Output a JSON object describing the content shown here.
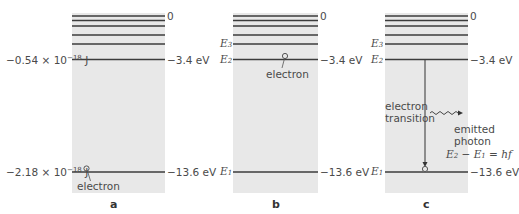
{
  "colors": {
    "box_fill": "#e8e8e8",
    "level_line": "#3c3c3c",
    "text": "#4a4a4a"
  },
  "panels": [
    {
      "id": "a",
      "label": "a",
      "top_level_label": "0",
      "upper_level_right": "−3.4 eV",
      "upper_level_left": "−0.54 × 10",
      "upper_level_left_exp": "−18",
      "upper_level_left_unit": " J",
      "ground_level_right": "−13.6 eV",
      "ground_level_left": "−2.18 × 10",
      "ground_level_left_exp": "−18",
      "ground_level_left_unit": " J",
      "electron_label": "electron"
    },
    {
      "id": "b",
      "label": "b",
      "top_level_label": "0",
      "upper_level_right": "−3.4 eV",
      "ground_level_right": "−13.6 eV",
      "e3_label": "E",
      "e3_sub": "3",
      "e2_label": "E",
      "e2_sub": "2",
      "e1_label": "E",
      "e1_sub": "1",
      "electron_label": "electron"
    },
    {
      "id": "c",
      "label": "c",
      "top_level_label": "0",
      "upper_level_right": "−3.4 eV",
      "ground_level_right": "−13.6 eV",
      "e3_label": "E",
      "e3_sub": "3",
      "e2_label": "E",
      "e2_sub": "2",
      "e1_label": "E",
      "e1_sub": "1",
      "transition_label_1": "electron",
      "transition_label_2": "transition",
      "photon_label_1": "emitted",
      "photon_label_2": "photon",
      "equation_e2": "E",
      "equation_e2_sub": "2",
      "equation_minus": " − ",
      "equation_e1": "E",
      "equation_e1_sub": "1",
      "equation_rhs": " = hf"
    }
  ]
}
